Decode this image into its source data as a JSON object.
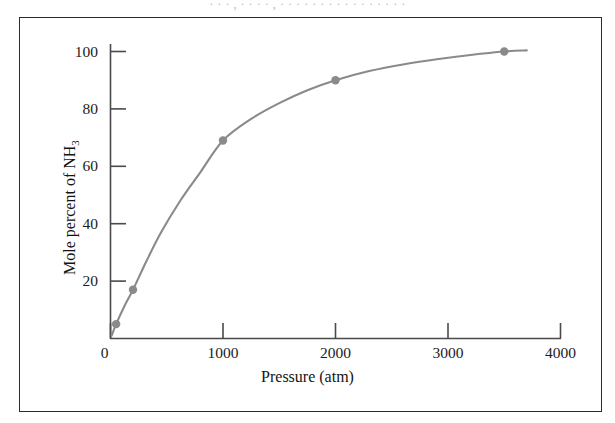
{
  "figure": {
    "caption_sliver": "· · · , · · · · , · · · · · · · · · · · · · · · ·",
    "frame_color": "#2b2b2b",
    "background_color": "#ffffff"
  },
  "chart_data": {
    "type": "line",
    "title": "",
    "subtitle": "",
    "xlabel": "Pressure (atm)",
    "ylabel": "Mole percent of NH3",
    "ylabel_html": "Mole percent of NH<sub>3</sub>",
    "xlim": [
      0,
      4000
    ],
    "ylim": [
      0,
      104
    ],
    "xticks": [
      0,
      1000,
      2000,
      3000,
      4000
    ],
    "xtick_labels": [
      "0",
      "1000",
      "2000",
      "3000",
      "4000"
    ],
    "yticks": [
      20,
      40,
      60,
      80,
      100
    ],
    "ytick_labels": [
      "20",
      "40",
      "60",
      "80",
      "100"
    ],
    "grid": false,
    "legend": null,
    "series": [
      {
        "name": "Mole percent NH3 vs pressure",
        "color": "#8a8a8a",
        "marker": "circle",
        "marker_color": "#8a8a8a",
        "x": [
          50,
          200,
          1000,
          2000,
          3500
        ],
        "y": [
          5,
          17,
          69,
          90,
          100
        ],
        "curve_x": [
          10,
          50,
          120,
          200,
          320,
          450,
          620,
          800,
          1000,
          1250,
          1500,
          1750,
          2000,
          2300,
          2600,
          2900,
          3200,
          3500,
          3700
        ],
        "curve_y": [
          1,
          5,
          11,
          17,
          27,
          37,
          48,
          58,
          69,
          76.5,
          82,
          86.5,
          90,
          93.2,
          95.5,
          97.3,
          98.8,
          100,
          100.4
        ]
      }
    ],
    "annotations": []
  },
  "axes": {
    "x_axis_name": "pressure-axis",
    "y_axis_name": "mole-percent-axis",
    "axis_color": "#4a4a4a"
  }
}
